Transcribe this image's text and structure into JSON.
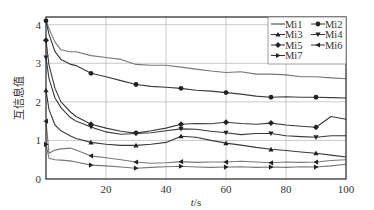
{
  "chart_data": {
    "type": "line",
    "title": "",
    "xlabel": "t/s",
    "ylabel": "互信息值",
    "xlim": [
      0,
      100
    ],
    "ylim": [
      0,
      4.2
    ],
    "xticks": [
      20,
      40,
      60,
      80,
      100
    ],
    "yticks": [
      0,
      1,
      2,
      3,
      4
    ],
    "grid": true,
    "legend_position": "upper right",
    "x": [
      0,
      1,
      3,
      5,
      8,
      10,
      15,
      20,
      25,
      30,
      35,
      40,
      45,
      50,
      55,
      60,
      65,
      70,
      75,
      80,
      85,
      90,
      95,
      100
    ],
    "series": [
      {
        "name": "Mi1",
        "marker": "none",
        "values": [
          4.1,
          3.9,
          3.55,
          3.35,
          3.3,
          3.3,
          3.2,
          3.15,
          3.1,
          2.97,
          2.95,
          2.95,
          2.9,
          2.85,
          2.8,
          2.76,
          2.78,
          2.72,
          2.72,
          2.7,
          2.65,
          2.65,
          2.62,
          2.6
        ]
      },
      {
        "name": "Mi2",
        "marker": "circle",
        "values": [
          4.1,
          3.75,
          3.3,
          3.1,
          2.98,
          2.94,
          2.74,
          2.65,
          2.55,
          2.45,
          2.4,
          2.38,
          2.35,
          2.3,
          2.28,
          2.24,
          2.2,
          2.15,
          2.12,
          2.13,
          2.12,
          2.12,
          2.11,
          2.1
        ]
      },
      {
        "name": "Mi3",
        "marker": "triangle-up",
        "values": [
          2.3,
          1.8,
          1.4,
          1.25,
          1.12,
          1.05,
          0.95,
          0.9,
          0.87,
          0.87,
          0.9,
          0.95,
          1.11,
          1.08,
          1.0,
          0.93,
          0.88,
          0.82,
          0.77,
          0.74,
          0.7,
          0.67,
          0.62,
          0.57
        ]
      },
      {
        "name": "Mi4",
        "marker": "triangle-down",
        "values": [
          3.15,
          2.6,
          2.1,
          1.85,
          1.6,
          1.5,
          1.35,
          1.22,
          1.16,
          1.18,
          1.2,
          1.25,
          1.3,
          1.29,
          1.24,
          1.2,
          1.15,
          1.18,
          1.18,
          1.12,
          1.1,
          1.08,
          1.12,
          1.12
        ]
      },
      {
        "name": "Mi5",
        "marker": "diamond",
        "values": [
          3.6,
          2.95,
          2.35,
          2.0,
          1.75,
          1.62,
          1.42,
          1.32,
          1.24,
          1.19,
          1.25,
          1.32,
          1.42,
          1.44,
          1.43,
          1.47,
          1.44,
          1.42,
          1.45,
          1.4,
          1.37,
          1.34,
          1.62,
          1.55
        ]
      },
      {
        "name": "Mi6",
        "marker": "triangle-left",
        "values": [
          1.5,
          0.67,
          0.75,
          0.78,
          0.8,
          0.75,
          0.6,
          0.55,
          0.5,
          0.44,
          0.41,
          0.42,
          0.45,
          0.43,
          0.44,
          0.44,
          0.46,
          0.44,
          0.42,
          0.44,
          0.43,
          0.44,
          0.48,
          0.5
        ]
      },
      {
        "name": "Mi7",
        "marker": "triangle-right",
        "values": [
          0.9,
          0.54,
          0.5,
          0.49,
          0.47,
          0.44,
          0.36,
          0.34,
          0.31,
          0.28,
          0.3,
          0.32,
          0.33,
          0.31,
          0.3,
          0.31,
          0.32,
          0.3,
          0.31,
          0.3,
          0.32,
          0.31,
          0.34,
          0.38
        ]
      }
    ],
    "marker_x": [
      15,
      30,
      45,
      60,
      75,
      90
    ]
  },
  "legend": {
    "rows": [
      [
        {
          "name": "Mi1",
          "marker": "none"
        },
        {
          "name": "Mi2",
          "marker": "circle"
        }
      ],
      [
        {
          "name": "Mi3",
          "marker": "triangle-up"
        },
        {
          "name": "Mi4",
          "marker": "triangle-down"
        }
      ],
      [
        {
          "name": "Mi5",
          "marker": "diamond"
        },
        {
          "name": "Mi6",
          "marker": "triangle-left"
        }
      ],
      [
        {
          "name": "Mi7",
          "marker": "triangle-right"
        }
      ]
    ]
  },
  "colors": {
    "line": "#3a3a3a",
    "line_light": "#777777",
    "grid": "#bdbdbd",
    "axis": "#222222"
  }
}
